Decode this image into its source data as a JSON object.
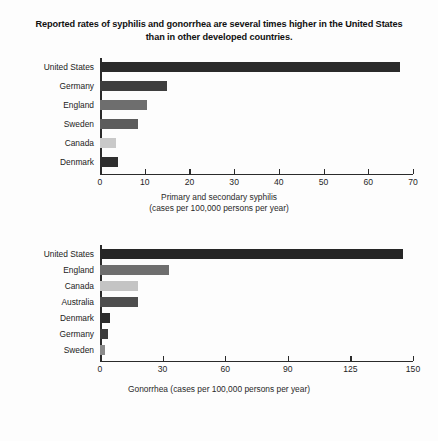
{
  "title": "Reported rates of syphilis and gonorrhea are several times higher in the United States than in other developed countries.",
  "chart_data": [
    {
      "type": "bar",
      "orientation": "horizontal",
      "title": "",
      "xlabel": "Primary and secondary syphilis (cases per 100,000 persons per year)",
      "caption_line1": "Primary and secondary syphilis",
      "caption_line2": "(cases per 100,000 persons per year)",
      "ylabel": "",
      "categories": [
        "United States",
        "Germany",
        "England",
        "Sweden",
        "Canada",
        "Denmark"
      ],
      "values": [
        67,
        15,
        10.5,
        8.5,
        3.5,
        4
      ],
      "colors": [
        "#2b2b2b",
        "#3e3e3e",
        "#6e6e6e",
        "#5c5c5c",
        "#c9c9c9",
        "#2f2f2f"
      ],
      "ticks": [
        "0",
        "10",
        "20",
        "30",
        "40",
        "50",
        "60",
        "70"
      ],
      "tick_values": [
        0,
        10,
        20,
        30,
        40,
        50,
        60,
        70
      ],
      "xlim": [
        0,
        70
      ],
      "grid": false,
      "legend": "none"
    },
    {
      "type": "bar",
      "orientation": "horizontal",
      "title": "",
      "xlabel": "Gonorrhea (cases per 100,000 persons per year)",
      "caption_line1": "Gonorrhea (cases per 100,000 persons per year)",
      "caption_line2": "",
      "ylabel": "",
      "categories": [
        "United States",
        "England",
        "Canada",
        "Australia",
        "Denmark",
        "Germany",
        "Sweden"
      ],
      "values": [
        145,
        33,
        18,
        18,
        5,
        4,
        2.5
      ],
      "colors": [
        "#262626",
        "#6e6e6e",
        "#c4c4c4",
        "#4e4e4e",
        "#2c2c2c",
        "#3c3c3c",
        "#8a8a8a"
      ],
      "ticks": [
        "0",
        "30",
        "60",
        "90",
        "125",
        "150"
      ],
      "tick_values": [
        0,
        30,
        60,
        90,
        120,
        150
      ],
      "xlim": [
        0,
        150
      ],
      "grid": false,
      "legend": "none"
    }
  ]
}
